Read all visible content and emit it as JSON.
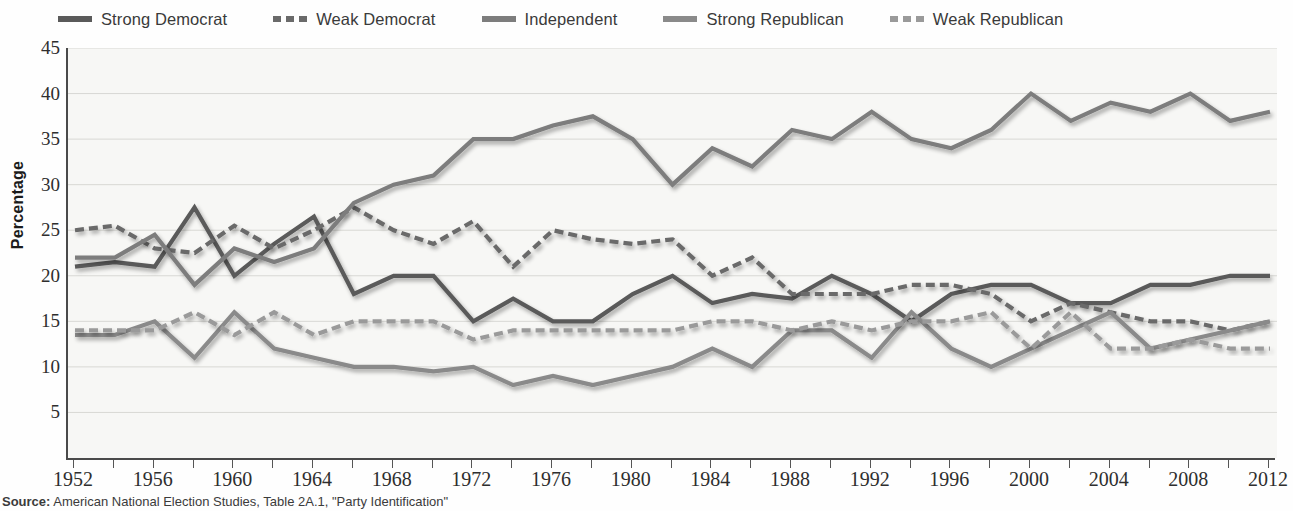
{
  "legend": {
    "position": "top",
    "items": [
      {
        "label": "Strong Democrat",
        "style": "solid",
        "color": "#5a5a5a"
      },
      {
        "label": "Weak Democrat",
        "style": "dashed",
        "color": "#6a6a6a"
      },
      {
        "label": "Independent",
        "style": "solid",
        "color": "#7d7d7d"
      },
      {
        "label": "Strong Republican",
        "style": "solid",
        "color": "#8a8a8a"
      },
      {
        "label": "Weak Republican",
        "style": "dashed",
        "color": "#9a9a9a"
      }
    ]
  },
  "axes": {
    "y_title": "Percentage",
    "y_ticks": [
      5,
      10,
      15,
      20,
      25,
      30,
      35,
      40,
      45
    ],
    "y_min": 0,
    "y_max": 45,
    "x_tick_labels": [
      1952,
      1956,
      1960,
      1964,
      1968,
      1972,
      1976,
      1980,
      1984,
      1988,
      1992,
      1996,
      2000,
      2004,
      2008,
      2012
    ],
    "x_min": 1952,
    "x_max": 2012,
    "x_tick_step": 2,
    "grid": "horizontal"
  },
  "source": {
    "label": "Source:",
    "text": " American National Election Studies, Table 2A.1, \"Party Identification\""
  },
  "chart_data": {
    "type": "line",
    "title": "",
    "xlabel": "",
    "ylabel": "Percentage",
    "xlim": [
      1952,
      2012
    ],
    "ylim": [
      0,
      45
    ],
    "grid": true,
    "legend_position": "top",
    "x": [
      1952,
      1954,
      1956,
      1958,
      1960,
      1962,
      1964,
      1966,
      1968,
      1970,
      1972,
      1974,
      1976,
      1978,
      1980,
      1982,
      1984,
      1986,
      1988,
      1990,
      1992,
      1994,
      1996,
      1998,
      2000,
      2002,
      2004,
      2006,
      2008,
      2010,
      2012
    ],
    "series": [
      {
        "name": "Strong Democrat",
        "style": "solid",
        "color": "#5a5a5a",
        "values": [
          21.0,
          21.5,
          21.0,
          27.5,
          20.0,
          23.5,
          26.5,
          18.0,
          20.0,
          20.0,
          15.0,
          17.5,
          15.0,
          15.0,
          18.0,
          20.0,
          17.0,
          18.0,
          17.5,
          20.0,
          18.0,
          15.0,
          18.0,
          19.0,
          19.0,
          17.0,
          17.0,
          19.0,
          19.0,
          20.0,
          20.0
        ]
      },
      {
        "name": "Weak Democrat",
        "style": "dashed",
        "color": "#6a6a6a",
        "values": [
          25.0,
          25.5,
          23.0,
          22.5,
          25.5,
          23.0,
          25.0,
          27.5,
          25.0,
          23.5,
          26.0,
          21.0,
          25.0,
          24.0,
          23.5,
          24.0,
          20.0,
          22.0,
          18.0,
          18.0,
          18.0,
          19.0,
          19.0,
          18.0,
          15.0,
          17.0,
          16.0,
          15.0,
          15.0,
          14.0,
          15.0
        ]
      },
      {
        "name": "Independent",
        "style": "solid",
        "color": "#7d7d7d",
        "values": [
          22.0,
          22.0,
          24.5,
          19.0,
          23.0,
          21.5,
          23.0,
          28.0,
          30.0,
          31.0,
          35.0,
          35.0,
          36.5,
          37.5,
          35.0,
          30.0,
          34.0,
          32.0,
          36.0,
          35.0,
          38.0,
          35.0,
          34.0,
          36.0,
          40.0,
          37.0,
          39.0,
          38.0,
          40.0,
          37.0,
          38.0
        ]
      },
      {
        "name": "Strong Republican",
        "style": "solid",
        "color": "#8a8a8a",
        "values": [
          13.5,
          13.5,
          15.0,
          11.0,
          16.0,
          12.0,
          11.0,
          10.0,
          10.0,
          9.5,
          10.0,
          8.0,
          9.0,
          8.0,
          9.0,
          10.0,
          12.0,
          10.0,
          14.0,
          14.0,
          11.0,
          16.0,
          12.0,
          10.0,
          12.0,
          14.0,
          16.0,
          12.0,
          13.0,
          14.0,
          15.0
        ]
      },
      {
        "name": "Weak Republican",
        "style": "dashed",
        "color": "#9a9a9a",
        "values": [
          14.0,
          14.0,
          14.0,
          16.0,
          13.5,
          16.0,
          13.5,
          15.0,
          15.0,
          15.0,
          13.0,
          14.0,
          14.0,
          14.0,
          14.0,
          14.0,
          15.0,
          15.0,
          14.0,
          15.0,
          14.0,
          15.0,
          15.0,
          16.0,
          12.0,
          16.0,
          12.0,
          12.0,
          13.0,
          12.0,
          12.0
        ]
      }
    ]
  }
}
